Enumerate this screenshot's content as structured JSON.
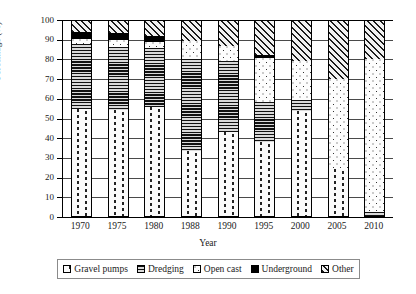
{
  "chart_data": {
    "type": "bar",
    "stacked": true,
    "title": "",
    "xlabel": "Year",
    "ylabel": "Percentage (%)",
    "ylim": [
      0,
      100
    ],
    "ytick_step": 10,
    "yticks": [
      0,
      10,
      20,
      30,
      40,
      50,
      60,
      70,
      80,
      90,
      100
    ],
    "grid": true,
    "legend_position": "bottom",
    "categories": [
      "1970",
      "1975",
      "1980",
      "1988",
      "1990",
      "1995",
      "2000",
      "2005",
      "2010"
    ],
    "series": [
      {
        "name": "Gravel pumps",
        "pattern": "vertical-dashed",
        "values": [
          55,
          54.5,
          56,
          33.5,
          43,
          38,
          54,
          24.5,
          0
        ]
      },
      {
        "name": "Dredging",
        "pattern": "horizontal-lines",
        "values": [
          33,
          32,
          30,
          46.5,
          36,
          20.5,
          5.5,
          0,
          2.5
        ]
      },
      {
        "name": "Open cast",
        "pattern": "dotted",
        "values": [
          2.5,
          3.5,
          3,
          9.5,
          8,
          22,
          19.5,
          45.5,
          77.5
        ]
      },
      {
        "name": "Underground",
        "pattern": "solid-black",
        "values": [
          3.5,
          3.5,
          3,
          0,
          0,
          1.5,
          0,
          0,
          0
        ]
      },
      {
        "name": "Other",
        "pattern": "diagonal-hatch",
        "values": [
          6,
          6.5,
          8,
          10.5,
          13,
          18,
          21,
          30,
          20
        ]
      }
    ],
    "cumulative_tops": [
      [
        55,
        88,
        90.5,
        94,
        100
      ],
      [
        54.5,
        86.5,
        90,
        93.5,
        100
      ],
      [
        56,
        86,
        89,
        92,
        100
      ],
      [
        33.5,
        80,
        89.5,
        89.5,
        100
      ],
      [
        43,
        79,
        87,
        87,
        100
      ],
      [
        38,
        58.5,
        80.5,
        82,
        100
      ],
      [
        54,
        59.5,
        79,
        79,
        100
      ],
      [
        24.5,
        24.5,
        70,
        70,
        100
      ],
      [
        0,
        2.5,
        80,
        80,
        100
      ]
    ],
    "colors": {
      "axis": "#000000",
      "grid": "#4a4a4a",
      "background": "#ffffff",
      "ink": "#1a1a1a"
    }
  },
  "legend": {
    "items": [
      {
        "label": "Gravel pumps",
        "pattern": "vertical-dashed"
      },
      {
        "label": "Dredging",
        "pattern": "horizontal-lines"
      },
      {
        "label": "Open cast",
        "pattern": "dotted"
      },
      {
        "label": "Underground",
        "pattern": "solid-black"
      },
      {
        "label": "Other",
        "pattern": "diagonal-hatch"
      }
    ]
  }
}
